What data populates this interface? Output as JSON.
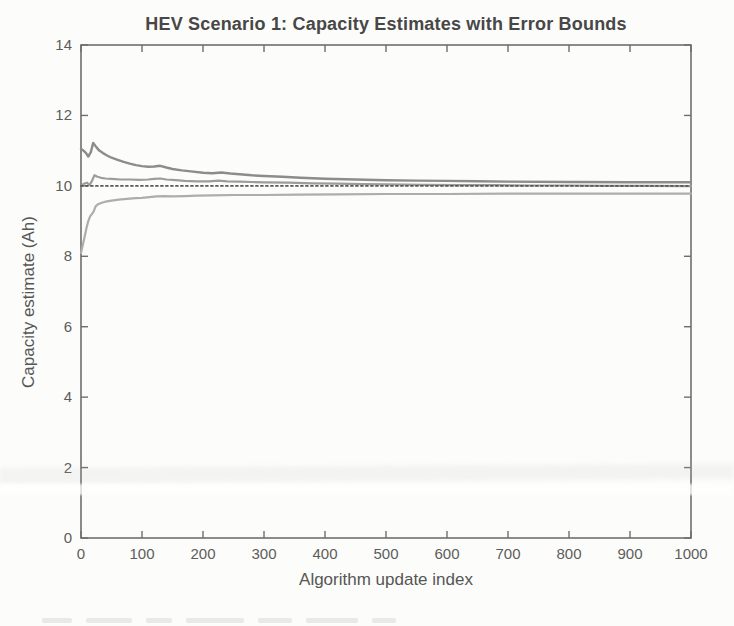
{
  "page": {
    "background": "#fcfcfa"
  },
  "chart_data": {
    "type": "line",
    "title": "HEV Scenario 1: Capacity Estimates with Error Bounds",
    "xlabel": "Algorithm update index",
    "ylabel": "Capacity estimate (Ah)",
    "xlim": [
      0,
      1000
    ],
    "ylim": [
      0,
      14
    ],
    "xticks": [
      0,
      100,
      200,
      300,
      400,
      500,
      600,
      700,
      800,
      900,
      1000
    ],
    "yticks": [
      0,
      2,
      4,
      6,
      8,
      10,
      12,
      14
    ],
    "grid": false,
    "legend": "none",
    "box": true,
    "frame_color": "#6e6e6e",
    "tick_label_color": "#5c5c5c",
    "title_color": "#474747",
    "series": [
      {
        "name": "upper-error-bound",
        "style": "solid",
        "color": "#8c8c8c",
        "width": 2.4,
        "points": [
          [
            0,
            11.05
          ],
          [
            4,
            11.0
          ],
          [
            8,
            10.94
          ],
          [
            12,
            10.83
          ],
          [
            16,
            10.96
          ],
          [
            20,
            11.22
          ],
          [
            25,
            11.1
          ],
          [
            30,
            11.0
          ],
          [
            36,
            10.93
          ],
          [
            42,
            10.87
          ],
          [
            50,
            10.8
          ],
          [
            60,
            10.74
          ],
          [
            70,
            10.68
          ],
          [
            80,
            10.63
          ],
          [
            90,
            10.59
          ],
          [
            100,
            10.56
          ],
          [
            110,
            10.54
          ],
          [
            120,
            10.55
          ],
          [
            130,
            10.57
          ],
          [
            140,
            10.52
          ],
          [
            150,
            10.48
          ],
          [
            165,
            10.44
          ],
          [
            180,
            10.41
          ],
          [
            200,
            10.37
          ],
          [
            215,
            10.36
          ],
          [
            230,
            10.38
          ],
          [
            245,
            10.35
          ],
          [
            260,
            10.33
          ],
          [
            280,
            10.3
          ],
          [
            300,
            10.28
          ],
          [
            330,
            10.26
          ],
          [
            360,
            10.23
          ],
          [
            400,
            10.2
          ],
          [
            450,
            10.18
          ],
          [
            500,
            10.16
          ],
          [
            550,
            10.15
          ],
          [
            600,
            10.14
          ],
          [
            650,
            10.13
          ],
          [
            700,
            10.12
          ],
          [
            800,
            10.11
          ],
          [
            900,
            10.1
          ],
          [
            1000,
            10.1
          ]
        ]
      },
      {
        "name": "lower-error-bound",
        "style": "solid",
        "color": "#adadaa",
        "width": 2.2,
        "points": [
          [
            0,
            8.1
          ],
          [
            3,
            8.32
          ],
          [
            6,
            8.56
          ],
          [
            9,
            8.8
          ],
          [
            12,
            9.0
          ],
          [
            15,
            9.14
          ],
          [
            18,
            9.2
          ],
          [
            21,
            9.28
          ],
          [
            24,
            9.42
          ],
          [
            28,
            9.48
          ],
          [
            34,
            9.52
          ],
          [
            40,
            9.55
          ],
          [
            50,
            9.58
          ],
          [
            62,
            9.61
          ],
          [
            75,
            9.63
          ],
          [
            90,
            9.65
          ],
          [
            100,
            9.66
          ],
          [
            112,
            9.68
          ],
          [
            124,
            9.7
          ],
          [
            136,
            9.71
          ],
          [
            150,
            9.7
          ],
          [
            170,
            9.71
          ],
          [
            190,
            9.72
          ],
          [
            215,
            9.73
          ],
          [
            250,
            9.74
          ],
          [
            300,
            9.74
          ],
          [
            360,
            9.75
          ],
          [
            420,
            9.76
          ],
          [
            500,
            9.77
          ],
          [
            600,
            9.77
          ],
          [
            700,
            9.78
          ],
          [
            850,
            9.78
          ],
          [
            1000,
            9.78
          ]
        ]
      },
      {
        "name": "capacity-estimate",
        "style": "solid",
        "color": "#9c9c9a",
        "width": 2.2,
        "points": [
          [
            0,
            10.0
          ],
          [
            5,
            10.06
          ],
          [
            10,
            10.09
          ],
          [
            14,
            10.02
          ],
          [
            18,
            10.14
          ],
          [
            22,
            10.3
          ],
          [
            27,
            10.26
          ],
          [
            33,
            10.23
          ],
          [
            40,
            10.21
          ],
          [
            50,
            10.2
          ],
          [
            65,
            10.18
          ],
          [
            80,
            10.18
          ],
          [
            95,
            10.17
          ],
          [
            110,
            10.18
          ],
          [
            120,
            10.2
          ],
          [
            130,
            10.21
          ],
          [
            140,
            10.18
          ],
          [
            155,
            10.16
          ],
          [
            170,
            10.14
          ],
          [
            190,
            10.13
          ],
          [
            210,
            10.13
          ],
          [
            225,
            10.15
          ],
          [
            240,
            10.13
          ],
          [
            260,
            10.12
          ],
          [
            280,
            10.11
          ],
          [
            300,
            10.1
          ],
          [
            340,
            10.09
          ],
          [
            380,
            10.07
          ],
          [
            420,
            10.06
          ],
          [
            460,
            10.05
          ],
          [
            500,
            10.04
          ],
          [
            560,
            10.03
          ],
          [
            620,
            10.02
          ],
          [
            680,
            10.02
          ],
          [
            740,
            10.01
          ],
          [
            800,
            10.01
          ],
          [
            860,
            10.0
          ],
          [
            920,
            10.0
          ],
          [
            1000,
            9.99
          ]
        ]
      },
      {
        "name": "true-capacity",
        "style": "dotted",
        "color": "#585858",
        "width": 1.9,
        "points": [
          [
            0,
            10.0
          ],
          [
            1000,
            10.0
          ]
        ]
      }
    ]
  }
}
